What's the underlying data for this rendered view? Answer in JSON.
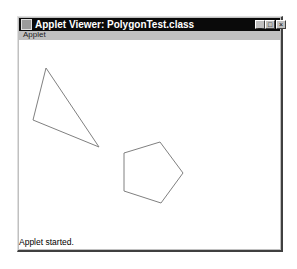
{
  "window": {
    "title": "Applet Viewer: PolygonTest.class",
    "controls": [
      "minimize",
      "maximize",
      "close"
    ]
  },
  "menubar": {
    "items": [
      {
        "label": "Applet"
      }
    ]
  },
  "canvas": {
    "shapes": [
      {
        "type": "triangle",
        "points": [
          [
            46,
            68
          ],
          [
            33,
            120
          ],
          [
            99,
            147
          ]
        ],
        "stroke": "#808080"
      },
      {
        "type": "pentagon",
        "points": [
          [
            124,
            153
          ],
          [
            160,
            142
          ],
          [
            183,
            173
          ],
          [
            161,
            203
          ],
          [
            124,
            191
          ]
        ],
        "stroke": "#808080"
      }
    ]
  },
  "status": {
    "text": "Applet started."
  }
}
